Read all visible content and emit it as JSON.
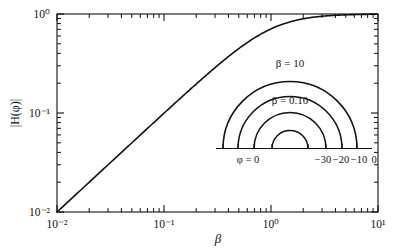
{
  "figure": {
    "background_color": "#ffffff",
    "line_color": "#111111",
    "frame": {
      "x0": 57,
      "y0": 14,
      "x1": 378,
      "y1": 212
    }
  },
  "chart_data": {
    "type": "line",
    "title": "",
    "subtitle": "",
    "xlabel": "β",
    "ylabel": "|H(φ)|",
    "xscale": "log",
    "yscale": "log",
    "xlim": [
      0.01,
      10
    ],
    "ylim": [
      0.01,
      1
    ],
    "grid": false,
    "legend": "none",
    "xticks": [
      0.01,
      0.1,
      1,
      10
    ],
    "xticklabels": [
      "10⁻²",
      "10⁻¹",
      "10⁰",
      "10¹"
    ],
    "yticks": [
      0.01,
      0.1,
      1
    ],
    "yticklabels": [
      "10⁻²",
      "10⁻¹",
      "10⁰"
    ],
    "series": [
      {
        "name": "|H(φ)|",
        "formula": "beta / sqrt(1 + beta^2)",
        "x": [
          0.01,
          0.0126,
          0.0158,
          0.02,
          0.0251,
          0.0316,
          0.0398,
          0.0501,
          0.0631,
          0.0794,
          0.1,
          0.126,
          0.158,
          0.2,
          0.251,
          0.316,
          0.398,
          0.501,
          0.631,
          0.794,
          1.0,
          1.26,
          1.58,
          2.0,
          2.51,
          3.16,
          3.98,
          5.01,
          6.31,
          7.94,
          10.0
        ],
        "y": [
          0.01,
          0.0126,
          0.0158,
          0.02,
          0.0251,
          0.0316,
          0.0398,
          0.0501,
          0.063,
          0.0792,
          0.0995,
          0.125,
          0.1561,
          0.1961,
          0.2437,
          0.3018,
          0.3702,
          0.4483,
          0.5334,
          0.6222,
          0.7071,
          0.7833,
          0.8448,
          0.8944,
          0.9292,
          0.9532,
          0.97,
          0.9806,
          0.9876,
          0.9921,
          0.995
        ]
      }
    ],
    "annotations": []
  },
  "inset": {
    "name": "polar-phase-inset",
    "description": "Four concentric semicircular contours on a horizontal baseline",
    "baseline_ticks": [
      {
        "value": "0",
        "label": "φ = 0",
        "label_side": "left"
      },
      {
        "value": "-30",
        "label": "−30",
        "label_side": "right"
      },
      {
        "value": "-20",
        "label": "−20",
        "label_side": "right"
      },
      {
        "value": "-10",
        "label": "−10",
        "label_side": "right"
      },
      {
        "value": "0r",
        "label": "0",
        "label_side": "right"
      }
    ],
    "axis_labels": {
      "left": "φ = 0",
      "right_values": [
        "−30",
        "−20",
        "−10",
        "0"
      ]
    },
    "arc_labels": [
      {
        "text": "β = 10",
        "arc_index": 0
      },
      {
        "text": "β = 0.10",
        "arc_index": 2
      }
    ],
    "arcs": [
      {
        "radius_px": 67,
        "label": "β = 10"
      },
      {
        "radius_px": 52,
        "label": ""
      },
      {
        "radius_px": 36,
        "label": "β = 0.10"
      },
      {
        "radius_px": 18,
        "label": ""
      }
    ],
    "center": {
      "x": 290,
      "y": 148
    }
  }
}
